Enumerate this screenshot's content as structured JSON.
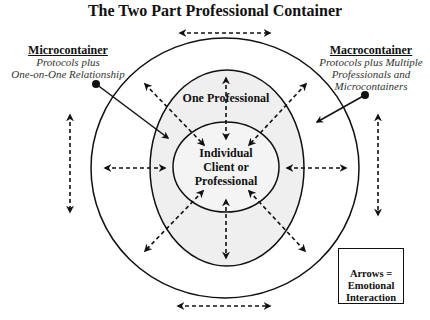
{
  "title": "The Two Part Professional Container",
  "microcontainer": {
    "heading": "Microcontainer",
    "line1": "Protocols plus",
    "line2": "One-on-One Relationship"
  },
  "macrocontainer": {
    "heading": "Macrocontainer",
    "line1": "Protocols plus Multiple",
    "line2": "Professionals and",
    "line3": "Microcontainers"
  },
  "middle_label": "One Professional",
  "center": {
    "line1": "Individual",
    "line2": "Client or",
    "line3": "Professional"
  },
  "legend": {
    "line1": "Arrows =",
    "line2": "Emotional",
    "line3": "Interaction"
  },
  "colors": {
    "line": "#111111",
    "middle_fill": "#efefef",
    "inner_fill": "#f4f4f4",
    "background": "#ffffff"
  }
}
